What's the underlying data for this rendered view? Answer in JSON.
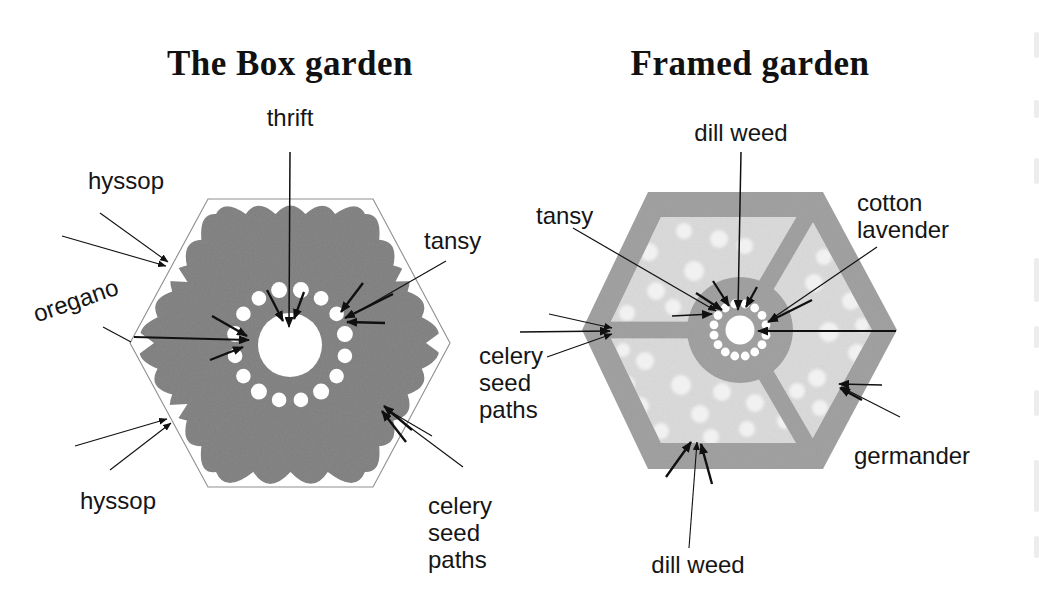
{
  "figure": {
    "left_garden": {
      "title": "The Box garden",
      "labels": {
        "thrift": "thrift",
        "hyssop_top": "hyssop",
        "oregano": "oregano",
        "tansy": "tansy",
        "hyssop_bottom": "hyssop",
        "celery_seed_paths": "celery\nseed\npaths"
      }
    },
    "right_garden": {
      "title": "Framed garden",
      "labels": {
        "dill_weed_top": "dill weed",
        "tansy": "tansy",
        "cotton_lavender": "cotton\nlavender",
        "celery_seed_paths": "celery\nseed\npaths",
        "germander": "germander",
        "dill_weed_bottom": "dill weed"
      }
    },
    "colors": {
      "hedge_gray": "#848484",
      "frame_gray": "#a0a0a0",
      "bed_gray": "#d9d9d9",
      "plant_dot": "#f1f1f1",
      "outline_gray": "#8f8f8f",
      "ink": "#141414"
    }
  }
}
